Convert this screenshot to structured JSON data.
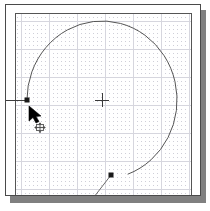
{
  "app": {
    "window_title": "Drawing Canvas",
    "panel_name": "drawing-viewport"
  },
  "theme": {
    "background": "#ffffff",
    "panel_border": "#4a4a4a",
    "frame_border": "#555555",
    "shadow": "#808080",
    "grid_major": "#d0d0d8",
    "grid_minor": "#c8c8d0",
    "geometry_stroke": "#555555",
    "node_fill": "#1a1a1a",
    "cursor_fill": "#000000"
  },
  "canvas": {
    "grid": {
      "visible": true,
      "major_spacing_px": 28,
      "minor_tick_spacing_px": 4,
      "origin_x_px": 15,
      "origin_y_px": 16,
      "style": "dotted"
    },
    "center_marker": {
      "name": "center-crosshair",
      "x_px": 96,
      "y_px": 95,
      "arm_px": 7,
      "label": ""
    },
    "geometry": [
      {
        "id": "arc-spiral",
        "type": "arc",
        "label": "circular arc",
        "center_x_px": 96,
        "center_y_px": 95,
        "radius_px": 79,
        "start_angle_deg": 180,
        "end_angle_deg": 430
      },
      {
        "id": "tangent-line",
        "type": "line",
        "label": "tangent segment",
        "x1_px": 105,
        "y1_px": 170,
        "x2_px": 88,
        "y2_px": 192
      },
      {
        "id": "construction-line",
        "type": "line",
        "label": "horizontal construction line",
        "x1_px": 0,
        "y1_px": 95,
        "x2_px": 22,
        "y2_px": 95
      }
    ],
    "nodes": [
      {
        "id": "node-start",
        "name": "grip-node-start",
        "x_px": 21,
        "y_px": 95,
        "shape": "square",
        "size_px": 4
      },
      {
        "id": "node-end",
        "name": "grip-node-end",
        "x_px": 105,
        "y_px": 170,
        "shape": "square",
        "size_px": 4
      }
    ]
  },
  "cursor": {
    "name": "move-cursor",
    "kind": "arrow-with-pan-badge",
    "x_px": 24,
    "y_px": 103,
    "badge_label": "move"
  }
}
